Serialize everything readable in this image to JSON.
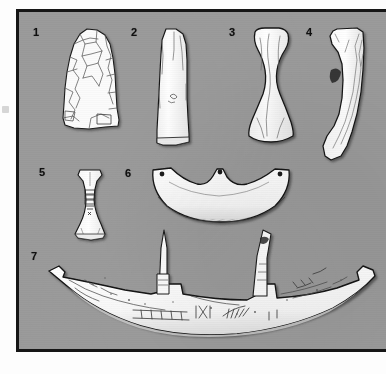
{
  "figure": {
    "kind": "archaeological-artifact-plate",
    "background_color": "#9b9b9b",
    "frame_color": "#161616",
    "artifact_fill": "#fbfbfb",
    "artifact_outline": "#1a1a1a",
    "shading_color": "#8f8f8f",
    "label_color": "#101010",
    "items": [
      {
        "number": "1",
        "name": "flaked-flint-axe",
        "x": 28,
        "y": 22
      },
      {
        "number": "2",
        "name": "polished-stone-adze",
        "x": 128,
        "y": 22
      },
      {
        "number": "3",
        "name": "waisted-stone-axe",
        "x": 226,
        "y": 22
      },
      {
        "number": "4",
        "name": "curved-stone-adze-profile",
        "x": 303,
        "y": 22
      },
      {
        "number": "5",
        "name": "small-engraved-axe",
        "x": 34,
        "y": 162
      },
      {
        "number": "6",
        "name": "perforated-crescentic-blade",
        "x": 122,
        "y": 163
      },
      {
        "number": "7",
        "name": "large-engraved-curved-implement",
        "x": 28,
        "y": 246
      }
    ]
  }
}
